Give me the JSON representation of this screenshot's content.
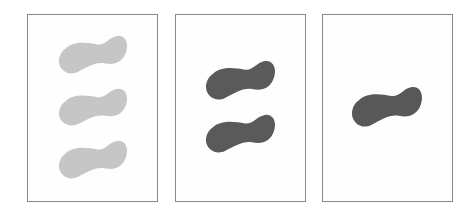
{
  "figure": {
    "panels": [
      {
        "id": "panel-1",
        "blob_count": 3,
        "blob_color": "#c6c6c6",
        "box": {
          "x": 27,
          "y": 14,
          "w": 131,
          "h": 188
        },
        "blobs": [
          {
            "x": 58,
            "y": 35,
            "w": 69,
            "h": 38
          },
          {
            "x": 58,
            "y": 88,
            "w": 69,
            "h": 37
          },
          {
            "x": 58,
            "y": 140,
            "w": 69,
            "h": 38
          }
        ]
      },
      {
        "id": "panel-2",
        "blob_count": 2,
        "blob_color": "#5a5a5a",
        "box": {
          "x": 175,
          "y": 14,
          "w": 131,
          "h": 188
        },
        "blobs": [
          {
            "x": 205,
            "y": 60,
            "w": 70,
            "h": 39
          },
          {
            "x": 205,
            "y": 114,
            "w": 70,
            "h": 38
          }
        ]
      },
      {
        "id": "panel-3",
        "blob_count": 1,
        "blob_color": "#585858",
        "box": {
          "x": 322,
          "y": 14,
          "w": 131,
          "h": 188
        },
        "blobs": [
          {
            "x": 351,
            "y": 86,
            "w": 71,
            "h": 40
          }
        ]
      }
    ],
    "colors": {
      "border": "#8a8a8a",
      "background": "#ffffff",
      "light_blob": "#c6c6c6",
      "dark_blob": "#5a5a5a"
    }
  }
}
